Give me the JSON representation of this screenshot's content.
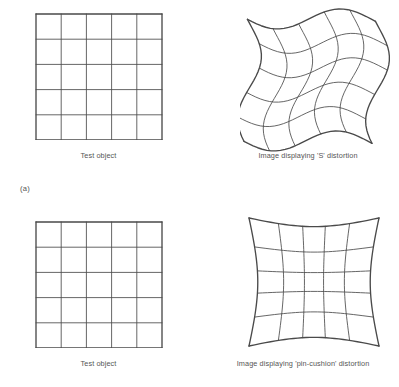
{
  "figure": {
    "part_label_a": "(a)",
    "panels": [
      {
        "id": "test-object-a",
        "caption": "Test object",
        "grid_type": "regular",
        "rows": 5,
        "cols": 5
      },
      {
        "id": "s-distortion",
        "caption": "Image displaying 'S' distortion",
        "grid_type": "s-distortion",
        "rows": 5,
        "cols": 5
      },
      {
        "id": "test-object-b",
        "caption": "Test object",
        "grid_type": "regular",
        "rows": 5,
        "cols": 5
      },
      {
        "id": "pincushion",
        "caption": "Image displaying 'pin-cushion' distortion",
        "grid_type": "pincushion",
        "rows": 5,
        "cols": 5
      }
    ]
  },
  "chart_data": {
    "type": "diagram",
    "title": "",
    "subtitle": "",
    "panel_count": 4,
    "grid_divisions": 5,
    "colors": {
      "line": "#4a4a4a",
      "background": "#ffffff",
      "text": "#555555"
    },
    "geometry": {
      "test_object_a": {
        "x": 35,
        "y": 13,
        "width": 127,
        "height": 126
      },
      "s_distortion": {
        "x": 240,
        "y": 8,
        "width": 145,
        "height": 138
      },
      "test_object_b": {
        "x": 35,
        "y": 221,
        "width": 127,
        "height": 126
      },
      "pincushion": {
        "x": 240,
        "y": 212,
        "width": 145,
        "height": 135
      }
    },
    "distortions": [
      {
        "name": "S distortion",
        "description": "Sinusoidal S-shaped warping of rows and columns",
        "amplitude_x": 9,
        "amplitude_y": 11,
        "cycles": 1
      },
      {
        "name": "pin-cushion distortion",
        "description": "Edges pulled inward toward centre, corners extended outward",
        "strength": 0.17
      }
    ],
    "labels": [
      "Test object",
      "Image displaying 'S' distortion",
      "Test object",
      "Image displaying 'pin-cushion' distortion",
      "(a)"
    ]
  }
}
